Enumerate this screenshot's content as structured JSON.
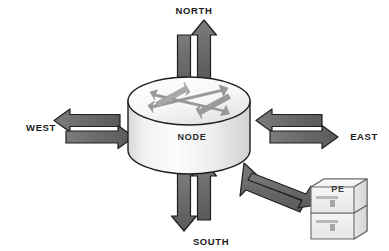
{
  "diagram": {
    "center": {
      "label": "NODE",
      "shape": "cylinder",
      "body_color": "#efefef",
      "top_color": "#fbfbfb",
      "outline_color": "#1f1f1f"
    },
    "directions": [
      {
        "id": "north",
        "label": "NORTH",
        "position": "top",
        "arrows": [
          {
            "name": "north-inbound-arrow",
            "direction": "down",
            "meaning": "into-node"
          },
          {
            "name": "north-outbound-arrow",
            "direction": "up",
            "meaning": "out-of-node"
          }
        ]
      },
      {
        "id": "west",
        "label": "WEST",
        "position": "left",
        "arrows": [
          {
            "name": "west-outbound-arrow",
            "direction": "left",
            "meaning": "out-of-node"
          },
          {
            "name": "west-inbound-arrow",
            "direction": "right",
            "meaning": "into-node"
          }
        ]
      },
      {
        "id": "east",
        "label": "EAST",
        "position": "right",
        "arrows": [
          {
            "name": "east-inbound-arrow",
            "direction": "left",
            "meaning": "into-node"
          },
          {
            "name": "east-outbound-arrow",
            "direction": "right",
            "meaning": "out-of-node"
          }
        ]
      },
      {
        "id": "south",
        "label": "SOUTH",
        "position": "bottom",
        "arrows": [
          {
            "name": "south-outbound-arrow",
            "direction": "down",
            "meaning": "out-of-node"
          },
          {
            "name": "south-inbound-arrow",
            "direction": "up",
            "meaning": "into-node"
          }
        ]
      }
    ],
    "peer": {
      "id": "pe",
      "label": "PE",
      "shape": "stacked-device-boxes",
      "box_count": 2,
      "position": "bottom-right",
      "arrows": [
        {
          "name": "pe-inbound-arrow",
          "direction": "up-left",
          "meaning": "into-node"
        },
        {
          "name": "pe-outbound-arrow",
          "direction": "down-right",
          "meaning": "out-of-node"
        }
      ]
    },
    "internal_arrows": {
      "name": "node-internal-crossing-arrows",
      "count": 2,
      "style": "double-headed",
      "pattern": "X-cross",
      "color": "#8e8e8e"
    },
    "colors": {
      "arrow_fill": "#6e6e6e",
      "arrow_fill_light": "#8e8e8e",
      "arrow_stroke": "#1f1f1f",
      "text": "#1b1b1b",
      "background": "#ffffff"
    }
  }
}
